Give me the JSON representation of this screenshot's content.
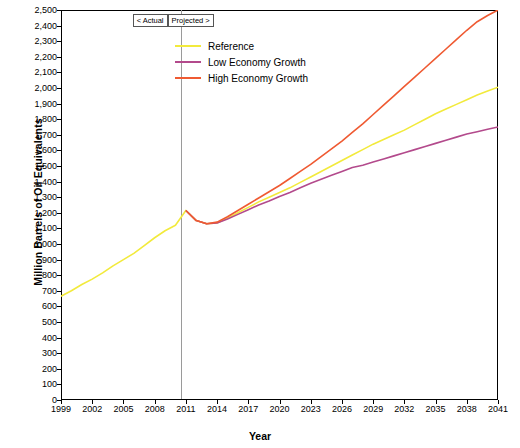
{
  "chart_data": {
    "type": "line",
    "title": "",
    "xlabel": "Year",
    "ylabel": "Million Barrels of Oil Equivalents",
    "xlim": [
      1999,
      2041
    ],
    "ylim": [
      0,
      2500
    ],
    "ytick_step": 100,
    "grid": false,
    "legend_position": "top-center",
    "xticks": [
      "1999",
      "2002",
      "2005",
      "2008",
      "2011",
      "2014",
      "2017",
      "2020",
      "2023",
      "2026",
      "2029",
      "2032",
      "2035",
      "2038",
      "2041"
    ],
    "yticks": [
      "0",
      "100",
      "200",
      "300",
      "400",
      "500",
      "600",
      "700",
      "800",
      "900",
      "1,000",
      "1,100",
      "1,200",
      "1,300",
      "1,400",
      "1,500",
      "1,600",
      "1,700",
      "1,800",
      "1,900",
      "2,000",
      "2,100",
      "2,200",
      "2,300",
      "2,400",
      "2,500"
    ],
    "annotations": [
      {
        "name": "actual-label",
        "text": "< Actual",
        "x": 2010
      },
      {
        "name": "projected-label",
        "text": "Projected >",
        "x": 2011
      },
      {
        "name": "divider",
        "text": "",
        "x": 2010.5
      }
    ],
    "series": [
      {
        "name": "Reference",
        "color": "#f2ea3c",
        "x": [
          1999,
          2000,
          2001,
          2002,
          2003,
          2004,
          2005,
          2006,
          2007,
          2008,
          2009,
          2010,
          2011,
          2012,
          2013,
          2014,
          2015,
          2016,
          2017,
          2018,
          2019,
          2020,
          2021,
          2022,
          2023,
          2024,
          2025,
          2026,
          2027,
          2028,
          2029,
          2030,
          2031,
          2032,
          2033,
          2034,
          2035,
          2036,
          2037,
          2038,
          2039,
          2040,
          2041
        ],
        "y": [
          665,
          700,
          740,
          775,
          815,
          860,
          900,
          940,
          990,
          1040,
          1085,
          1120,
          1215,
          1150,
          1130,
          1135,
          1165,
          1200,
          1235,
          1270,
          1300,
          1330,
          1360,
          1395,
          1430,
          1465,
          1500,
          1535,
          1570,
          1605,
          1640,
          1670,
          1700,
          1730,
          1765,
          1800,
          1835,
          1865,
          1895,
          1925,
          1955,
          1980,
          2005
        ]
      },
      {
        "name": "Low Economy Growth",
        "color": "#b34a8c",
        "x": [
          2011,
          2012,
          2013,
          2014,
          2015,
          2016,
          2017,
          2018,
          2019,
          2020,
          2021,
          2022,
          2023,
          2024,
          2025,
          2026,
          2027,
          2028,
          2029,
          2030,
          2031,
          2032,
          2033,
          2034,
          2035,
          2036,
          2037,
          2038,
          2039,
          2040,
          2041
        ],
        "y": [
          1215,
          1150,
          1130,
          1135,
          1160,
          1190,
          1220,
          1250,
          1275,
          1305,
          1330,
          1360,
          1390,
          1415,
          1440,
          1465,
          1490,
          1505,
          1525,
          1545,
          1565,
          1585,
          1605,
          1625,
          1645,
          1665,
          1685,
          1705,
          1720,
          1735,
          1750
        ]
      },
      {
        "name": "High Economy Growth",
        "color": "#ef5a32",
        "x": [
          2011,
          2012,
          2013,
          2014,
          2015,
          2016,
          2017,
          2018,
          2019,
          2020,
          2021,
          2022,
          2023,
          2024,
          2025,
          2026,
          2027,
          2028,
          2029,
          2030,
          2031,
          2032,
          2033,
          2034,
          2035,
          2036,
          2037,
          2038,
          2039,
          2040,
          2041
        ],
        "y": [
          1215,
          1150,
          1130,
          1140,
          1175,
          1215,
          1255,
          1295,
          1335,
          1375,
          1420,
          1465,
          1510,
          1560,
          1610,
          1660,
          1715,
          1770,
          1830,
          1890,
          1950,
          2010,
          2070,
          2130,
          2190,
          2250,
          2310,
          2370,
          2425,
          2465,
          2500
        ]
      }
    ]
  },
  "legend": {
    "items": [
      {
        "label": "Reference",
        "color": "#f2ea3c"
      },
      {
        "label": "Low Economy Growth",
        "color": "#b34a8c"
      },
      {
        "label": "High Economy Growth",
        "color": "#ef5a32"
      }
    ]
  }
}
